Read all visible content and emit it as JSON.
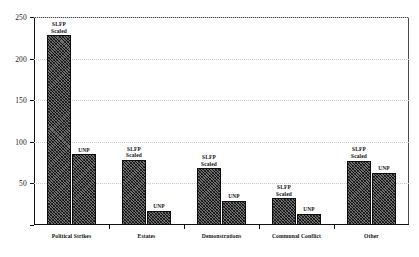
{
  "chart_data": {
    "type": "bar",
    "title": "",
    "subtitle": "",
    "xlabel": "",
    "ylabel": "",
    "ylim": [
      0,
      250
    ],
    "yticks": [
      0,
      50,
      100,
      150,
      200,
      250
    ],
    "ytick_labels": [
      "",
      "50",
      "100",
      "150",
      "200",
      "250"
    ],
    "grid": "horizontal-dotted",
    "legend": "none (bars labelled in-place)",
    "categories": [
      "Political Strikes",
      "Estates",
      "Demonstrations",
      "Communal Conflict",
      "Other"
    ],
    "series": [
      {
        "name": "SLFP Scaled",
        "label_text": "SLFP\nScaled",
        "values": [
          228,
          78,
          68,
          32,
          77
        ]
      },
      {
        "name": "UNP",
        "label_text": "UNP",
        "values": [
          85,
          17,
          29,
          13,
          63
        ]
      }
    ],
    "bar_fill_color": "#6f6f6f",
    "bar_edge_color": "#0d0d0d",
    "bar_hatch": "cross-diagonal",
    "gridline_color": "#c9c9c9",
    "axis_color": "#111111",
    "background_color": "#ffffff"
  }
}
